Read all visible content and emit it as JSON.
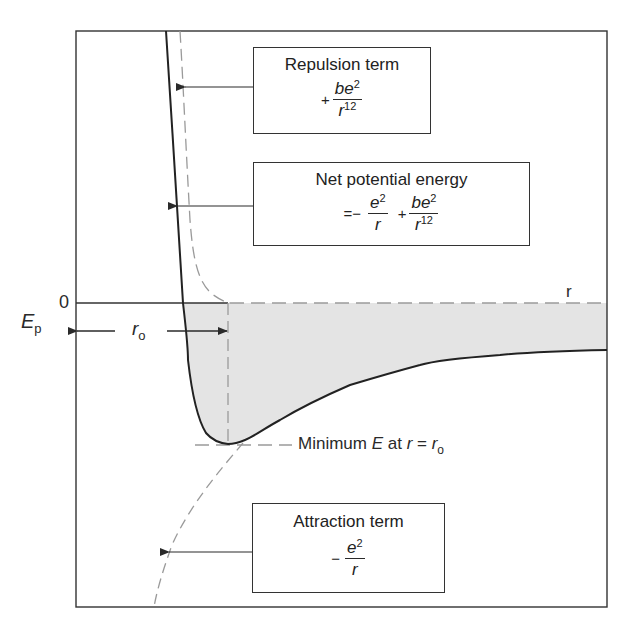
{
  "figure": {
    "colors": {
      "stroke": "#2a2a2a",
      "dashed": "#9a9a9a",
      "shade": "#e4e4e4",
      "frame": "#333333"
    },
    "axes": {
      "y_label_main": "E",
      "y_label_sub": "p",
      "zero_label": "0",
      "x_label": "r",
      "r0_main": "r",
      "r0_sub": "o"
    },
    "repulsion_box": {
      "title": "Repulsion term",
      "sign": "+",
      "num": "be",
      "num_exp": "2",
      "den": "r",
      "den_exp": "12"
    },
    "net_box": {
      "title": "Net potential energy",
      "prefix": "=−",
      "t1_num": "e",
      "t1_num_exp": "2",
      "t1_den": "r",
      "plus": "+",
      "t2_num": "be",
      "t2_num_exp": "2",
      "t2_den": "r",
      "t2_den_exp": "12"
    },
    "attraction_box": {
      "title": "Attraction term",
      "sign": "−",
      "num": "e",
      "num_exp": "2",
      "den": "r"
    },
    "minimum_label": {
      "prefix": "Minimum ",
      "e": "E",
      "mid": " at ",
      "r": "r",
      "eq": " = ",
      "r0": "r",
      "r0_sub": "o"
    }
  }
}
